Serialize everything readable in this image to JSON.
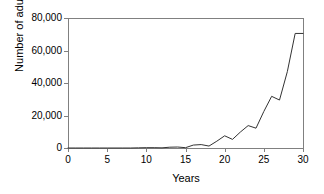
{
  "chart_data": {
    "type": "line",
    "title": "",
    "xlabel": "Years",
    "ylabel": "Number of adults",
    "xlim": [
      0,
      30
    ],
    "ylim": [
      0,
      80000
    ],
    "grid": false,
    "legend": null,
    "line_color": "#333333",
    "axis_color": "#808080",
    "x_ticks": [
      0,
      5,
      10,
      15,
      20,
      25,
      30
    ],
    "x_tick_labels": [
      "0",
      "5",
      "10",
      "15",
      "20",
      "25",
      "30"
    ],
    "y_ticks": [
      0,
      20000,
      40000,
      60000,
      80000
    ],
    "y_tick_labels": [
      "0",
      "20,000",
      "40,000",
      "60,000",
      "80,000"
    ],
    "series": [
      {
        "name": "Number of adults",
        "x": [
          0,
          1,
          2,
          3,
          4,
          5,
          6,
          7,
          8,
          9,
          10,
          11,
          12,
          13,
          14,
          15,
          16,
          17,
          18,
          19,
          20,
          21,
          22,
          23,
          24,
          25,
          26,
          27,
          28,
          29,
          30
        ],
        "values": [
          0,
          0,
          0,
          0,
          0,
          0,
          0,
          0,
          0,
          100,
          200,
          200,
          100,
          500,
          600,
          200,
          1800,
          2100,
          1200,
          4200,
          7500,
          5300,
          9800,
          13800,
          12200,
          22500,
          31800,
          29500,
          47000,
          70500,
          70500
        ]
      }
    ]
  },
  "axis_titles": {
    "x": "Years",
    "y": "Number of adults"
  }
}
